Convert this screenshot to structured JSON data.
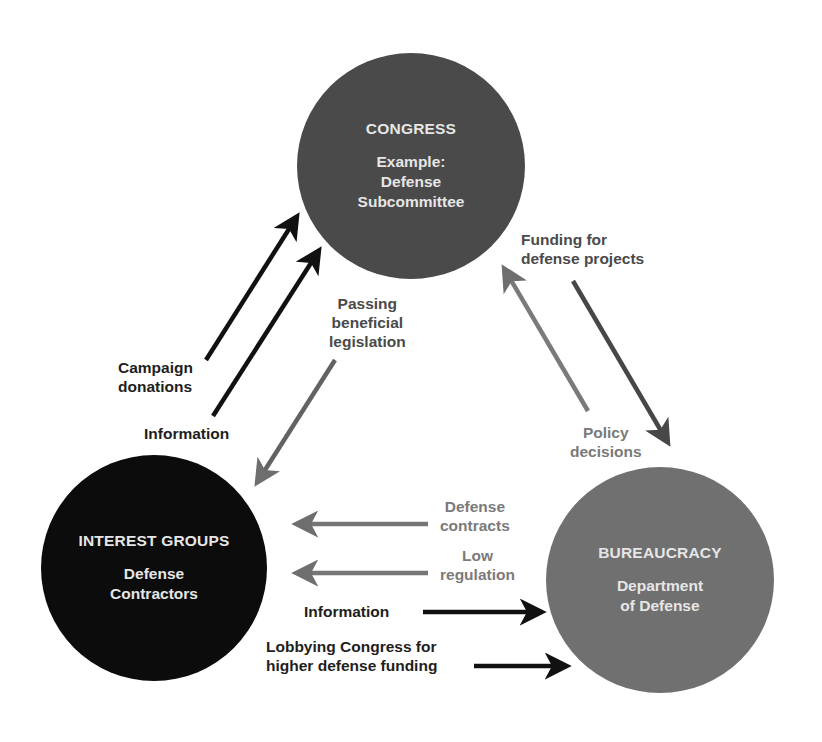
{
  "diagram": {
    "type": "iron-triangle",
    "colors": {
      "congress_fill": "#4a4a4a",
      "interest_groups_fill": "#0c0c0c",
      "bureaucracy_fill": "#707070",
      "arrow_black": "#111111",
      "arrow_dark_gray": "#474747",
      "arrow_gray": "#6e6e6e",
      "background": "#ffffff"
    },
    "nodes": {
      "congress": {
        "title": "CONGRESS",
        "subtitle": "Example:\nDefense\nSubcommittee"
      },
      "interest_groups": {
        "title": "INTEREST GROUPS",
        "subtitle": "Defense\nContractors"
      },
      "bureaucracy": {
        "title": "BUREAUCRACY",
        "subtitle": "Department\nof Defense"
      }
    },
    "edges": {
      "campaign_donations": {
        "label": "Campaign\ndonations",
        "from": "interest_groups",
        "to": "congress"
      },
      "information_to_congress": {
        "label": "Information",
        "from": "interest_groups",
        "to": "congress"
      },
      "passing_legislation": {
        "label": "Passing\nbeneficial\nlegislation",
        "from": "congress",
        "to": "interest_groups"
      },
      "funding": {
        "label": "Funding for\ndefense projects",
        "from": "congress",
        "to": "bureaucracy"
      },
      "policy_decisions": {
        "label": "Policy\ndecisions",
        "from": "bureaucracy",
        "to": "congress"
      },
      "defense_contracts": {
        "label": "Defense\ncontracts",
        "from": "bureaucracy",
        "to": "interest_groups"
      },
      "low_regulation": {
        "label": "Low\nregulation",
        "from": "bureaucracy",
        "to": "interest_groups"
      },
      "information_to_bureaucracy": {
        "label": "Information",
        "from": "interest_groups",
        "to": "bureaucracy"
      },
      "lobbying": {
        "label": "Lobbying Congress for\nhigher defense funding",
        "from": "interest_groups",
        "to": "bureaucracy"
      }
    }
  }
}
